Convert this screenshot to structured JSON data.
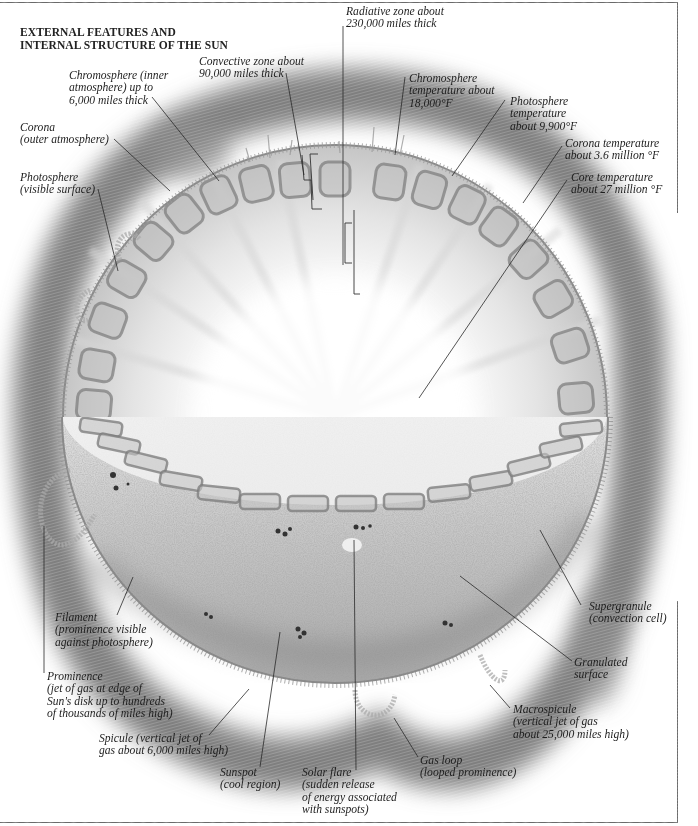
{
  "title": {
    "lines": [
      "EXTERNAL FEATURES AND",
      "INTERNAL STRUCTURE OF THE SUN"
    ]
  },
  "labels": {
    "convective_zone": {
      "lines": [
        "Convective zone about",
        "90,000 miles thick"
      ],
      "x": 199,
      "y": 56
    },
    "radiative_zone": {
      "lines": [
        "Radiative zone about",
        "230,000 miles thick"
      ],
      "x": 346,
      "y": 6
    },
    "chromosphere": {
      "lines": [
        "Chromosphere (inner",
        "atmosphere) up to",
        "6,000 miles thick"
      ],
      "x": 69,
      "y": 70
    },
    "chromosphere_temp": {
      "lines": [
        "Chromosphere",
        "temperature about",
        "18,000°F"
      ],
      "x": 409,
      "y": 73
    },
    "photosphere_temp": {
      "lines": [
        "Photosphere",
        "temperature",
        "about 9,900°F"
      ],
      "x": 510,
      "y": 96
    },
    "corona": {
      "lines": [
        "Corona",
        "(outer atmosphere)"
      ],
      "x": 20,
      "y": 122
    },
    "corona_temp": {
      "lines": [
        "Corona temperature",
        "about 3.6 million °F"
      ],
      "x": 565,
      "y": 138
    },
    "core_temp": {
      "lines": [
        "Core temperature",
        "about 27 million °F"
      ],
      "x": 571,
      "y": 172
    },
    "photosphere": {
      "lines": [
        "Photosphere",
        "(visible surface)"
      ],
      "x": 20,
      "y": 172
    },
    "filament": {
      "lines": [
        "Filament",
        "(prominence visible",
        "against photosphere)"
      ],
      "x": 55,
      "y": 612
    },
    "supergranule": {
      "lines": [
        "Supergranule",
        "(convection cell)"
      ],
      "x": 589,
      "y": 601
    },
    "granulated": {
      "lines": [
        "Granulated",
        "surface"
      ],
      "x": 574,
      "y": 657
    },
    "prominence": {
      "lines": [
        "Prominence",
        "(jet of gas at edge of",
        "Sun's disk up to hundreds",
        "of thousands of miles high)"
      ],
      "x": 47,
      "y": 671
    },
    "macrospicule": {
      "lines": [
        "Macrospicule",
        "(vertical jet of gas",
        "about 25,000 miles high)"
      ],
      "x": 513,
      "y": 704
    },
    "spicule": {
      "lines": [
        "Spicule (vertical jet of",
        "gas about 6,000 miles high)"
      ],
      "x": 99,
      "y": 733
    },
    "gas_loop": {
      "lines": [
        "Gas loop",
        "(looped prominence)"
      ],
      "x": 420,
      "y": 755
    },
    "sunspot": {
      "lines": [
        "Sunspot",
        "(cool region)"
      ],
      "x": 220,
      "y": 767
    },
    "solar_flare": {
      "lines": [
        "Solar flare",
        "(sudden release",
        "of energy associated",
        "with sunspots)"
      ],
      "x": 302,
      "y": 767
    }
  },
  "colors": {
    "ink": "#1e1e1e",
    "corona_band": "#8a8a8a",
    "surface": "#b8b8b8",
    "cell_outline": "#7a7a7a",
    "frame": "#6a6a6a"
  }
}
